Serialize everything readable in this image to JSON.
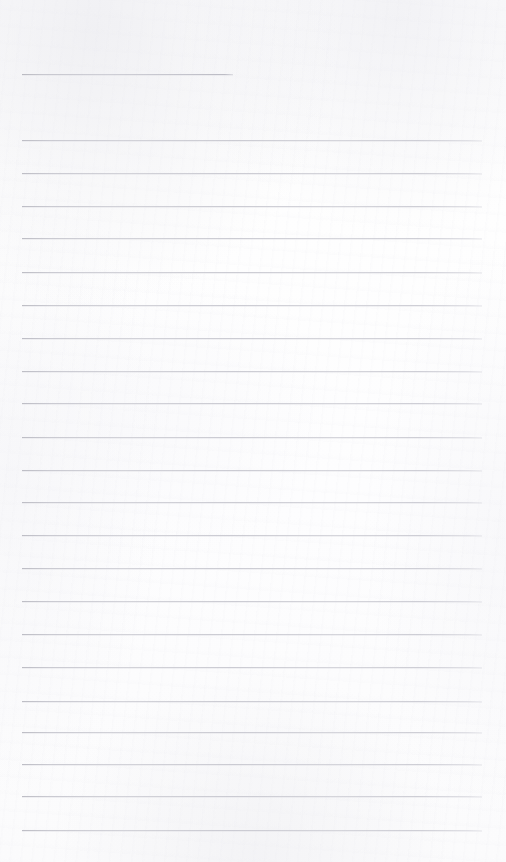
{
  "page": {
    "kind": "scanned-lined-paper",
    "width": 506,
    "height": 862,
    "background_color": "#fdfdfd",
    "rule_color": "#c6c6ce",
    "rule_thickness": 1,
    "content_text": "",
    "handwriting_text": "",
    "notes_text": ""
  },
  "rules": {
    "left": 22,
    "right": 482,
    "short_rule_right": 233,
    "spacing": 32.7,
    "count": 24,
    "items": [
      {
        "id": "rule-header",
        "y": 74,
        "x1": 22,
        "x2": 233,
        "variant": "short"
      },
      {
        "id": "rule-01",
        "y": 140,
        "x1": 22,
        "x2": 482,
        "variant": "full"
      },
      {
        "id": "rule-02",
        "y": 173,
        "x1": 22,
        "x2": 482,
        "variant": "full"
      },
      {
        "id": "rule-03",
        "y": 206,
        "x1": 22,
        "x2": 482,
        "variant": "full"
      },
      {
        "id": "rule-04",
        "y": 238,
        "x1": 22,
        "x2": 482,
        "variant": "full"
      },
      {
        "id": "rule-05",
        "y": 272,
        "x1": 22,
        "x2": 482,
        "variant": "full"
      },
      {
        "id": "rule-06",
        "y": 305,
        "x1": 22,
        "x2": 482,
        "variant": "full"
      },
      {
        "id": "rule-07",
        "y": 338,
        "x1": 22,
        "x2": 482,
        "variant": "full"
      },
      {
        "id": "rule-08",
        "y": 371,
        "x1": 22,
        "x2": 482,
        "variant": "full"
      },
      {
        "id": "rule-09",
        "y": 403,
        "x1": 22,
        "x2": 482,
        "variant": "full"
      },
      {
        "id": "rule-10",
        "y": 437,
        "x1": 22,
        "x2": 482,
        "variant": "full"
      },
      {
        "id": "rule-11",
        "y": 470,
        "x1": 22,
        "x2": 482,
        "variant": "full"
      },
      {
        "id": "rule-12",
        "y": 502,
        "x1": 22,
        "x2": 482,
        "variant": "full"
      },
      {
        "id": "rule-13",
        "y": 535,
        "x1": 22,
        "x2": 482,
        "variant": "full"
      },
      {
        "id": "rule-14",
        "y": 568,
        "x1": 22,
        "x2": 482,
        "variant": "full"
      },
      {
        "id": "rule-15",
        "y": 601,
        "x1": 22,
        "x2": 482,
        "variant": "full"
      },
      {
        "id": "rule-16",
        "y": 634,
        "x1": 22,
        "x2": 482,
        "variant": "full"
      },
      {
        "id": "rule-17",
        "y": 667,
        "x1": 22,
        "x2": 482,
        "variant": "full"
      },
      {
        "id": "rule-18",
        "y": 701,
        "x1": 22,
        "x2": 482,
        "variant": "full"
      },
      {
        "id": "rule-19",
        "y": 732,
        "x1": 22,
        "x2": 482,
        "variant": "full"
      },
      {
        "id": "rule-20",
        "y": 764,
        "x1": 22,
        "x2": 482,
        "variant": "full"
      },
      {
        "id": "rule-21",
        "y": 796,
        "x1": 22,
        "x2": 482,
        "variant": "full"
      },
      {
        "id": "rule-22",
        "y": 830,
        "x1": 22,
        "x2": 482,
        "variant": "full"
      }
    ]
  }
}
